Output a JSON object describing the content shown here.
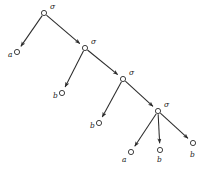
{
  "diagram": {
    "type": "tree",
    "width": 209,
    "height": 172,
    "background_color": "#ffffff",
    "edge_color": "#2b2b2b",
    "node_stroke_color": "#2b2b2b",
    "node_fill_color": "#ffffff",
    "label_color": "#1a1a1a",
    "nodes": [
      {
        "id": "n0",
        "label": "σ",
        "kind": "internal",
        "cx": 44,
        "cy": 13,
        "r": 2.6,
        "label_x": 50,
        "label_y": 7
      },
      {
        "id": "n1",
        "label": "a",
        "kind": "leaf",
        "cx": 17,
        "cy": 52,
        "r": 2.6,
        "label_x": 8,
        "label_y": 55
      },
      {
        "id": "n2",
        "label": "σ",
        "kind": "internal",
        "cx": 85,
        "cy": 48,
        "r": 2.6,
        "label_x": 91,
        "label_y": 42
      },
      {
        "id": "n3",
        "label": "b",
        "kind": "leaf",
        "cx": 62,
        "cy": 93,
        "r": 2.6,
        "label_x": 53,
        "label_y": 96
      },
      {
        "id": "n4",
        "label": "σ",
        "kind": "internal",
        "cx": 123,
        "cy": 79,
        "r": 2.6,
        "label_x": 129,
        "label_y": 73
      },
      {
        "id": "n5",
        "label": "b",
        "kind": "leaf",
        "cx": 99,
        "cy": 123,
        "r": 2.6,
        "label_x": 90,
        "label_y": 126
      },
      {
        "id": "n6",
        "label": "σ",
        "kind": "internal",
        "cx": 158,
        "cy": 111,
        "r": 2.6,
        "label_x": 164,
        "label_y": 105
      },
      {
        "id": "n7",
        "label": "a",
        "kind": "leaf",
        "cx": 131,
        "cy": 152,
        "r": 2.6,
        "label_x": 122,
        "label_y": 160
      },
      {
        "id": "n8",
        "label": "b",
        "kind": "leaf",
        "cx": 160,
        "cy": 150,
        "r": 2.6,
        "label_x": 157,
        "label_y": 160
      },
      {
        "id": "n9",
        "label": "b",
        "kind": "leaf",
        "cx": 193,
        "cy": 143,
        "r": 2.6,
        "label_x": 190,
        "label_y": 155
      }
    ],
    "edges": [
      {
        "id": "e0",
        "from": "n0",
        "to": "n1",
        "arrow": true
      },
      {
        "id": "e1",
        "from": "n0",
        "to": "n2",
        "arrow": true
      },
      {
        "id": "e2",
        "from": "n2",
        "to": "n3",
        "arrow": true
      },
      {
        "id": "e3",
        "from": "n2",
        "to": "n4",
        "arrow": true
      },
      {
        "id": "e4",
        "from": "n4",
        "to": "n5",
        "arrow": true
      },
      {
        "id": "e5",
        "from": "n4",
        "to": "n6",
        "arrow": true
      },
      {
        "id": "e6",
        "from": "n6",
        "to": "n7",
        "arrow": true
      },
      {
        "id": "e7",
        "from": "n6",
        "to": "n8",
        "arrow": true
      },
      {
        "id": "e8",
        "from": "n6",
        "to": "n9",
        "arrow": true
      }
    ]
  }
}
